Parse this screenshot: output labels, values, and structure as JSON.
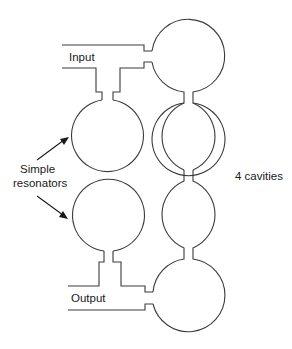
{
  "diagram": {
    "type": "coupled-cavity-filter",
    "labels": {
      "input": "Input",
      "output": "Output",
      "simple_resonators_line1": "Simple",
      "simple_resonators_line2": "resonators",
      "cavities": "4 cavities"
    },
    "colors": {
      "stroke": "#3a3a3a",
      "text": "#1a1a1a",
      "background": "#ffffff"
    },
    "components": {
      "right_column_cavities": 4,
      "left_column_simple_resonators": 2,
      "ports": [
        "Input",
        "Output"
      ]
    }
  }
}
